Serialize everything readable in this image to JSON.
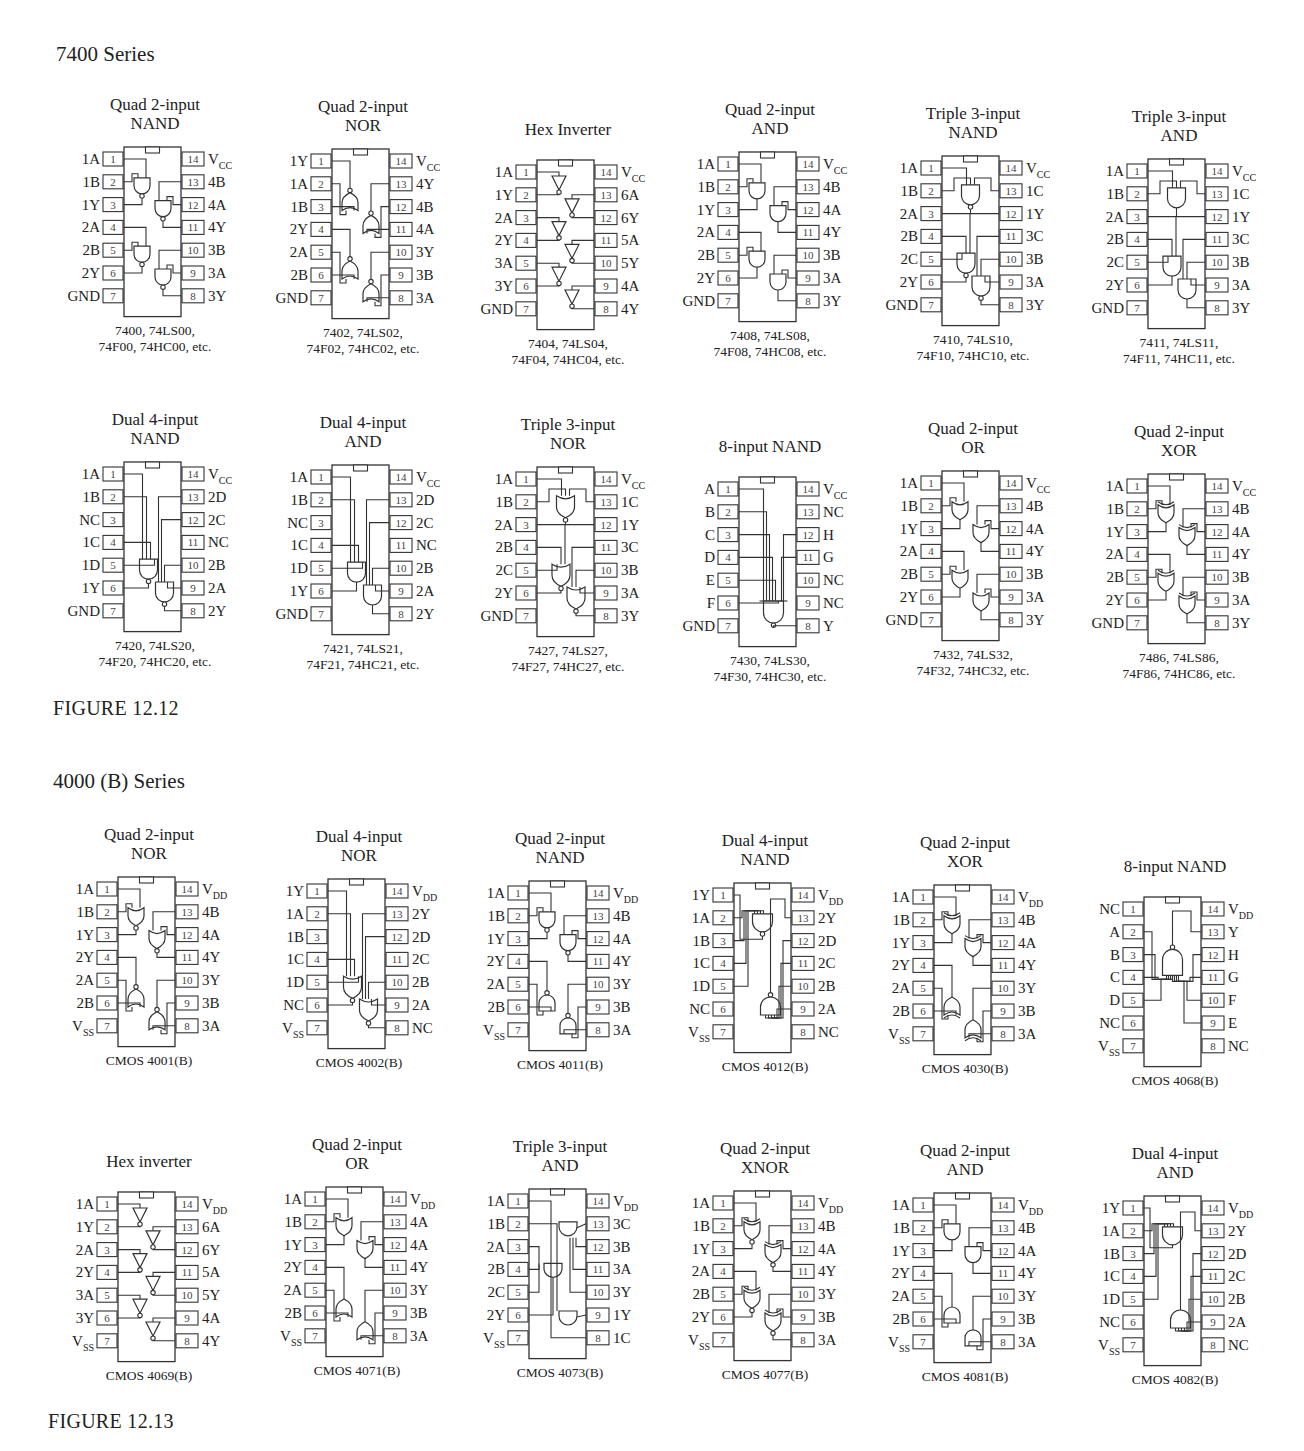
{
  "sections": [
    {
      "heading": "7400 Series",
      "figure_label": "FIGURE 12.12",
      "power_label": "V",
      "power_sub": "CC",
      "rows": [
        [
          {
            "title": [
              "Quad 2-input",
              "NAND"
            ],
            "gate": "nand2x4",
            "left": [
              "1A",
              "1B",
              "1Y",
              "2A",
              "2B",
              "2Y",
              "GND"
            ],
            "right": [
              "V|CC",
              "4B",
              "4A",
              "4Y",
              "3B",
              "3A",
              "3Y"
            ],
            "caption": [
              "7400, 74LS00,",
              "74F00, 74HC00, etc."
            ]
          },
          {
            "title": [
              "Quad 2-input",
              "NOR"
            ],
            "gate": "nor2x4",
            "left": [
              "1Y",
              "1A",
              "1B",
              "2Y",
              "2A",
              "2B",
              "GND"
            ],
            "right": [
              "V|CC",
              "4Y",
              "4B",
              "4A",
              "3Y",
              "3B",
              "3A"
            ],
            "caption": [
              "7402, 74LS02,",
              "74F02, 74HC02, etc."
            ]
          },
          {
            "title": [
              "Hex Inverter"
            ],
            "gate": "inv6",
            "left": [
              "1A",
              "1Y",
              "2A",
              "2Y",
              "3A",
              "3Y",
              "GND"
            ],
            "right": [
              "V|CC",
              "6A",
              "6Y",
              "5A",
              "5Y",
              "4A",
              "4Y"
            ],
            "caption": [
              "7404, 74LS04,",
              "74F04, 74HC04, etc."
            ]
          },
          {
            "title": [
              "Quad 2-input",
              "AND"
            ],
            "gate": "and2x4",
            "left": [
              "1A",
              "1B",
              "1Y",
              "2A",
              "2B",
              "2Y",
              "GND"
            ],
            "right": [
              "V|CC",
              "4B",
              "4A",
              "4Y",
              "3B",
              "3A",
              "3Y"
            ],
            "caption": [
              "7408, 74LS08,",
              "74F08, 74HC08, etc."
            ]
          },
          {
            "title": [
              "Triple 3-input",
              "NAND"
            ],
            "gate": "nand3x3",
            "left": [
              "1A",
              "1B",
              "2A",
              "2B",
              "2C",
              "2Y",
              "GND"
            ],
            "right": [
              "V|CC",
              "1C",
              "1Y",
              "3C",
              "3B",
              "3A",
              "3Y"
            ],
            "caption": [
              "7410, 74LS10,",
              "74F10, 74HC10, etc."
            ]
          },
          {
            "title": [
              "Triple 3-input",
              "AND"
            ],
            "gate": "and3x3",
            "left": [
              "1A",
              "1B",
              "2A",
              "2B",
              "2C",
              "2Y",
              "GND"
            ],
            "right": [
              "V|CC",
              "1C",
              "1Y",
              "3C",
              "3B",
              "3A",
              "3Y"
            ],
            "caption": [
              "7411, 74LS11,",
              "74F11, 74HC11, etc."
            ]
          }
        ],
        [
          {
            "title": [
              "Dual 4-input",
              "NAND"
            ],
            "gate": "nand4x2",
            "left": [
              "1A",
              "1B",
              "NC",
              "1C",
              "1D",
              "1Y",
              "GND"
            ],
            "right": [
              "V|CC",
              "2D",
              "2C",
              "NC",
              "2B",
              "2A",
              "2Y"
            ],
            "caption": [
              "7420, 74LS20,",
              "74F20, 74HC20, etc."
            ]
          },
          {
            "title": [
              "Dual 4-input",
              "AND"
            ],
            "gate": "and4x2",
            "left": [
              "1A",
              "1B",
              "NC",
              "1C",
              "1D",
              "1Y",
              "GND"
            ],
            "right": [
              "V|CC",
              "2D",
              "2C",
              "NC",
              "2B",
              "2A",
              "2Y"
            ],
            "caption": [
              "7421, 74LS21,",
              "74F21, 74HC21, etc."
            ]
          },
          {
            "title": [
              "Triple 3-input",
              "NOR"
            ],
            "gate": "nor3x3",
            "left": [
              "1A",
              "1B",
              "2A",
              "2B",
              "2C",
              "2Y",
              "GND"
            ],
            "right": [
              "V|CC",
              "1C",
              "1Y",
              "3C",
              "3B",
              "3A",
              "3Y"
            ],
            "caption": [
              "7427, 74LS27,",
              "74F27, 74HC27, etc."
            ]
          },
          {
            "title": [
              "8-input NAND"
            ],
            "gate": "nand8",
            "left": [
              "A",
              "B",
              "C",
              "D",
              "E",
              "F",
              "GND"
            ],
            "right": [
              "V|CC",
              "NC",
              "H",
              "G",
              "NC",
              "NC",
              "Y"
            ],
            "caption": [
              "7430, 74LS30,",
              "74F30, 74HC30, etc."
            ]
          },
          {
            "title": [
              "Quad 2-input",
              "OR"
            ],
            "gate": "or2x4",
            "left": [
              "1A",
              "1B",
              "1Y",
              "2A",
              "2B",
              "2Y",
              "GND"
            ],
            "right": [
              "V|CC",
              "4B",
              "4A",
              "4Y",
              "3B",
              "3A",
              "3Y"
            ],
            "caption": [
              "7432, 74LS32,",
              "74F32, 74HC32, etc."
            ]
          },
          {
            "title": [
              "Quad 2-input",
              "XOR"
            ],
            "gate": "xor2x4",
            "left": [
              "1A",
              "1B",
              "1Y",
              "2A",
              "2B",
              "2Y",
              "GND"
            ],
            "right": [
              "V|CC",
              "4B",
              "4A",
              "4Y",
              "3B",
              "3A",
              "3Y"
            ],
            "caption": [
              "7486, 74LS86,",
              "74F86, 74HC86, etc."
            ]
          }
        ]
      ]
    },
    {
      "heading": "4000 (B) Series",
      "figure_label": "FIGURE 12.13",
      "rows": [
        [
          {
            "title": [
              "Quad 2-input",
              "NOR"
            ],
            "gate": "nor2x4b",
            "left": [
              "1A",
              "1B",
              "1Y",
              "2Y",
              "2A",
              "2B",
              "V|SS"
            ],
            "right": [
              "V|DD",
              "4B",
              "4A",
              "4Y",
              "3Y",
              "3B",
              "3A"
            ],
            "caption": [
              "CMOS 4001(B)"
            ]
          },
          {
            "title": [
              "Dual 4-input",
              "NOR"
            ],
            "gate": "nor4x2",
            "left": [
              "1Y",
              "1A",
              "1B",
              "1C",
              "1D",
              "NC",
              "V|SS"
            ],
            "right": [
              "V|DD",
              "2Y",
              "2D",
              "2C",
              "2B",
              "2A",
              "NC"
            ],
            "caption": [
              "CMOS 4002(B)"
            ]
          },
          {
            "title": [
              "Quad 2-input",
              "NAND"
            ],
            "gate": "nand2x4b",
            "left": [
              "1A",
              "1B",
              "1Y",
              "2Y",
              "2A",
              "2B",
              "V|SS"
            ],
            "right": [
              "V|DD",
              "4B",
              "4A",
              "4Y",
              "3Y",
              "3B",
              "3A"
            ],
            "caption": [
              "CMOS 4011(B)"
            ]
          },
          {
            "title": [
              "Dual 4-input",
              "NAND"
            ],
            "gate": "nand4x2b",
            "left": [
              "1Y",
              "1A",
              "1B",
              "1C",
              "1D",
              "NC",
              "V|SS"
            ],
            "right": [
              "V|DD",
              "2Y",
              "2D",
              "2C",
              "2B",
              "2A",
              "NC"
            ],
            "caption": [
              "CMOS 4012(B)"
            ]
          },
          {
            "title": [
              "Quad 2-input",
              "XOR"
            ],
            "gate": "xor2x4b",
            "left": [
              "1A",
              "1B",
              "1Y",
              "2Y",
              "2A",
              "2B",
              "V|SS"
            ],
            "right": [
              "V|DD",
              "4B",
              "4A",
              "4Y",
              "3Y",
              "3B",
              "3A"
            ],
            "caption": [
              "CMOS 4030(B)"
            ]
          },
          {
            "title": [
              "8-input NAND"
            ],
            "gate": "nand8b",
            "left": [
              "NC",
              "A",
              "B",
              "C",
              "D",
              "NC",
              "V|SS"
            ],
            "right": [
              "V|DD",
              "Y",
              "H",
              "G",
              "F",
              "E",
              "NC"
            ],
            "caption": [
              "CMOS 4068(B)"
            ]
          }
        ],
        [
          {
            "title": [
              "Hex inverter"
            ],
            "gate": "inv6",
            "left": [
              "1A",
              "1Y",
              "2A",
              "2Y",
              "3A",
              "3Y",
              "V|SS"
            ],
            "right": [
              "V|DD",
              "6A",
              "6Y",
              "5A",
              "5Y",
              "4A",
              "4Y"
            ],
            "caption": [
              "CMOS 4069(B)"
            ]
          },
          {
            "title": [
              "Quad 2-input",
              "OR"
            ],
            "gate": "or2x4b",
            "left": [
              "1A",
              "1B",
              "1Y",
              "2Y",
              "2A",
              "2B",
              "V|SS"
            ],
            "right": [
              "V|DD",
              "4A",
              "4A",
              "4Y",
              "3Y",
              "3B",
              "3A"
            ],
            "caption": [
              "CMOS 4071(B)"
            ]
          },
          {
            "title": [
              "Triple 3-input",
              "AND"
            ],
            "gate": "and3x3b",
            "left": [
              "1A",
              "1B",
              "2A",
              "2B",
              "2C",
              "2Y",
              "V|SS"
            ],
            "right": [
              "V|DD",
              "3C",
              "3B",
              "3A",
              "3Y",
              "1Y",
              "1C"
            ],
            "caption": [
              "CMOS 4073(B)"
            ]
          },
          {
            "title": [
              "Quad 2-input",
              "XNOR"
            ],
            "gate": "xnor2x4",
            "left": [
              "1A",
              "1B",
              "1Y",
              "2A",
              "2B",
              "2Y",
              "V|SS"
            ],
            "right": [
              "V|DD",
              "4B",
              "4A",
              "4Y",
              "3Y",
              "3B",
              "3A"
            ],
            "caption": [
              "CMOS 4077(B)"
            ]
          },
          {
            "title": [
              "Quad 2-input",
              "AND"
            ],
            "gate": "and2x4b",
            "left": [
              "1A",
              "1B",
              "1Y",
              "2Y",
              "2A",
              "2B",
              "V|SS"
            ],
            "right": [
              "V|DD",
              "4B",
              "4A",
              "4Y",
              "3Y",
              "3B",
              "3A"
            ],
            "caption": [
              "CMOS 4081(B)"
            ]
          },
          {
            "title": [
              "Dual 4-input",
              "AND"
            ],
            "gate": "and4x2b",
            "left": [
              "1Y",
              "1A",
              "1B",
              "1C",
              "1D",
              "NC",
              "V|SS"
            ],
            "right": [
              "V|DD",
              "2Y",
              "2D",
              "2C",
              "2B",
              "2A",
              "NC"
            ],
            "caption": [
              "CMOS 4082(B)"
            ]
          }
        ]
      ]
    }
  ],
  "layout": {
    "headings": [
      {
        "x": 56,
        "y": 42
      },
      {
        "x": 53,
        "y": 769
      }
    ],
    "figure_labels": [
      {
        "x": 53,
        "y": 697
      },
      {
        "x": 48,
        "y": 1410
      }
    ],
    "rows": [
      [
        {
          "x": 50,
          "y": 95
        },
        {
          "x": 258,
          "y": 97
        },
        {
          "x": 463,
          "y": 108
        },
        {
          "x": 665,
          "y": 100
        },
        {
          "x": 868,
          "y": 104
        },
        {
          "x": 1074,
          "y": 107
        }
      ],
      [
        {
          "x": 50,
          "y": 410
        },
        {
          "x": 258,
          "y": 413
        },
        {
          "x": 463,
          "y": 415
        },
        {
          "x": 665,
          "y": 425
        },
        {
          "x": 868,
          "y": 419
        },
        {
          "x": 1074,
          "y": 422
        }
      ],
      [
        {
          "x": 44,
          "y": 825
        },
        {
          "x": 254,
          "y": 827
        },
        {
          "x": 455,
          "y": 829
        },
        {
          "x": 660,
          "y": 831
        },
        {
          "x": 860,
          "y": 833
        },
        {
          "x": 1070,
          "y": 845
        }
      ],
      [
        {
          "x": 44,
          "y": 1140
        },
        {
          "x": 252,
          "y": 1135
        },
        {
          "x": 455,
          "y": 1137
        },
        {
          "x": 660,
          "y": 1139
        },
        {
          "x": 860,
          "y": 1141
        },
        {
          "x": 1070,
          "y": 1144
        }
      ]
    ]
  }
}
